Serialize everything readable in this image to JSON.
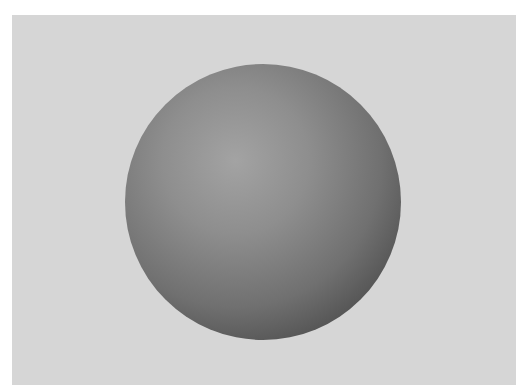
{
  "scene": {
    "description": "Shaded gray sphere on light gray background",
    "colors": {
      "background": "#d6d6d6",
      "border": "#ffffff",
      "sphere_highlight": "#a3a3a3",
      "sphere_shadow": "#3a3a3a"
    }
  }
}
